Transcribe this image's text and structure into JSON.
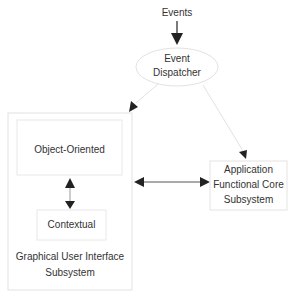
{
  "diagram": {
    "input_label": "Events",
    "dispatcher": {
      "line1": "Event",
      "line2": "Dispatcher"
    },
    "gui_subsystem": {
      "title_line1": "Graphical User Interface",
      "title_line2": "Subsystem",
      "object_oriented": "Object-Oriented",
      "contextual": "Contextual"
    },
    "core_subsystem": {
      "line1": "Application",
      "line2": "Functional Core",
      "line3": "Subsystem"
    },
    "colors": {
      "stroke": "#e4e4e4",
      "arrow": "#222222",
      "text": "#333333"
    }
  }
}
